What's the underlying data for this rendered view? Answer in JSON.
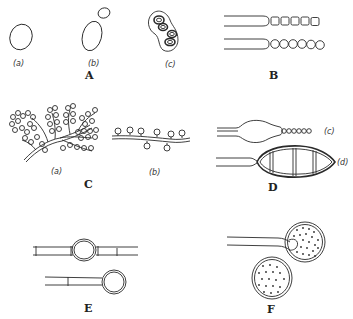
{
  "figure": {
    "panels": [
      {
        "id": "A",
        "label": "A",
        "subfigures": [
          "(a)",
          "(b)",
          "(c)"
        ]
      },
      {
        "id": "B",
        "label": "B",
        "subfigures": []
      },
      {
        "id": "C",
        "label": "C",
        "subfigures": [
          "(a)",
          "(b)"
        ]
      },
      {
        "id": "D",
        "label": "D",
        "subfigures": [
          "(c)",
          "(d)"
        ]
      },
      {
        "id": "E",
        "label": "E",
        "subfigures": []
      },
      {
        "id": "F",
        "label": "F",
        "subfigures": []
      }
    ]
  }
}
